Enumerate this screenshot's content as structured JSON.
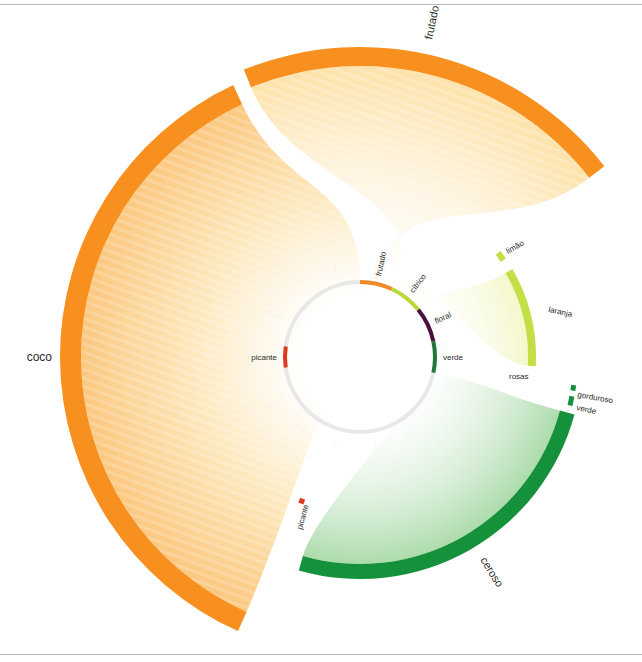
{
  "chart_data": {
    "type": "radial-flow",
    "title": "",
    "center": [
      360,
      357
    ],
    "inner_ring": {
      "radius": 75,
      "base_color": "#e8e8e8",
      "segments": [
        {
          "label": "frutado",
          "start": -90,
          "end": -65,
          "color": "#f08a2a"
        },
        {
          "label": "cítrico",
          "start": -65,
          "end": -39,
          "color": "#bcd93c"
        },
        {
          "label": "floral",
          "start": -39,
          "end": -12,
          "color": "#4a1040"
        },
        {
          "label": "verde",
          "start": -12,
          "end": 12,
          "color": "#1e7a3a"
        },
        {
          "label": "picante",
          "start": 172,
          "end": 188,
          "color": "#e03a1e"
        }
      ],
      "faint_labels": [
        {
          "label": "·····",
          "angle": -105
        },
        {
          "label": "······",
          "angle": -128
        },
        {
          "label": "·······",
          "angle": -153
        },
        {
          "label": "········",
          "angle": 152
        },
        {
          "label": "·····",
          "angle": 128
        },
        {
          "label": "····",
          "angle": 106
        },
        {
          "label": "·····",
          "angle": 80
        },
        {
          "label": "····",
          "angle": 58
        },
        {
          "label": "····",
          "angle": 30
        },
        {
          "label": "····",
          "angle": -75
        }
      ]
    },
    "outer_arcs": [
      {
        "label": "coco",
        "start": 114,
        "end": 245,
        "r_outer": 300,
        "thickness": 21,
        "color": "#f7901e",
        "fill": "#fbc77e",
        "label_pos": [
          60,
          357
        ],
        "label_rot": 0,
        "label_size": 11
      },
      {
        "label": "frutado",
        "start": 248,
        "end": 322,
        "r_outer": 310,
        "thickness": 19,
        "color": "#f7901e",
        "fill": "#fde4b0",
        "label_pos": [
          432,
          40
        ],
        "label_rot": -78,
        "label_size": 11
      },
      {
        "label": "ceroso",
        "start": 15,
        "end": 106,
        "r_outer": 222,
        "thickness": 15,
        "color": "#14913a",
        "fill": "#a8d9a8",
        "label_pos": [
          480,
          560
        ],
        "label_rot": 58,
        "label_size": 11
      },
      {
        "label": "laranja",
        "start": -30,
        "end": 3,
        "r_outer": 176,
        "thickness": 8,
        "color": "#c3df45",
        "fill": "#f6f8cf",
        "label_pos": [
          548,
          312
        ],
        "label_rot": 12,
        "label_size": 8
      },
      {
        "label": "limão",
        "start": -37,
        "end": -34,
        "r_outer": 176,
        "thickness": 6,
        "color": "#c3df45",
        "fill": null,
        "label_pos": [
          508,
          254
        ],
        "label_rot": -30,
        "label_size": 8
      },
      {
        "label": "gorduroso",
        "start": 7.5,
        "end": 9,
        "r_outer": 218,
        "thickness": 5,
        "color": "#14913a",
        "fill": null,
        "label_pos": [
          577,
          397
        ],
        "label_rot": 10,
        "label_size": 8
      },
      {
        "label": "verde",
        "start": 10.5,
        "end": 13,
        "r_outer": 218,
        "thickness": 5,
        "color": "#14913a",
        "fill": null,
        "label_pos": [
          576,
          410
        ],
        "label_rot": 12,
        "label_size": 8
      },
      {
        "label": "picante",
        "start": 111,
        "end": 113,
        "r_outer": 158,
        "thickness": 5,
        "color": "#e03a1e",
        "fill": null,
        "label_pos": [
          302,
          530
        ],
        "label_rot": -75,
        "label_size": 8
      },
      {
        "label": "rosas",
        "start": 0,
        "end": 0,
        "r_outer": 0,
        "thickness": 0,
        "color": "#2a2a2a",
        "fill": null,
        "label_pos": [
          509,
          379
        ],
        "label_rot": 0,
        "label_size": 8
      }
    ],
    "legend": null,
    "annotations": []
  },
  "labels": {
    "inner": {
      "frutado": "frutado",
      "citrico": "cítrico",
      "floral": "floral",
      "verde": "verde",
      "picante": "picante"
    },
    "outer": {
      "coco": "coco",
      "frutado": "frutado",
      "ceroso": "ceroso",
      "laranja": "laranja",
      "limao": "limão",
      "gorduroso": "gorduroso",
      "verde": "verde",
      "picante": "picante",
      "rosas": "rosas"
    }
  }
}
